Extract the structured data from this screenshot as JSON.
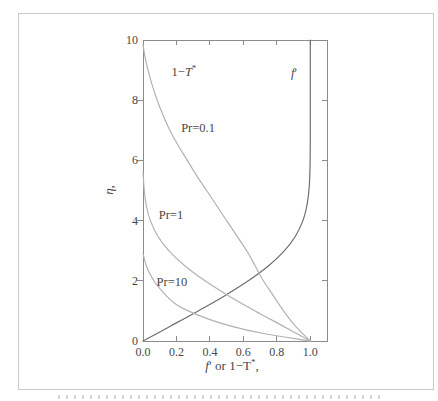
{
  "figure": {
    "background": "#ffffff",
    "border_color": "#c9c9c9"
  },
  "chart_data": {
    "type": "line",
    "title": "",
    "xlabel_parts": [
      {
        "t": "f",
        "i": true
      },
      {
        "t": "′"
      },
      {
        "t": " or 1−T"
      },
      {
        "t": "*",
        "sup": true
      },
      {
        "t": ","
      }
    ],
    "ylabel_parts": [
      {
        "t": "η",
        "i": true
      },
      {
        "t": ","
      }
    ],
    "xlim": [
      0,
      1.1
    ],
    "ylim": [
      0,
      10
    ],
    "xticks": {
      "values": [
        0,
        0.2,
        0.4,
        0.6,
        0.8,
        1.0
      ],
      "labels": [
        "0.0",
        "0.2",
        "0.4",
        "0.6",
        "0.8",
        "1.0"
      ]
    },
    "yticks": {
      "values": [
        0,
        2,
        4,
        6,
        8,
        10
      ],
      "labels": [
        "0",
        "2",
        "4",
        "6",
        "8",
        "10"
      ]
    },
    "grid": false,
    "frame": true,
    "legend": "none (in-plot annotations)",
    "colors": {
      "velocity_curve": "#6e6e6e",
      "temperature_curves": "#b2b2b2",
      "frame": "#8b8b8b",
      "text": "#474747"
    },
    "series": [
      {
        "name": "f' (Blasius velocity profile)",
        "color_key": "velocity_curve",
        "points": [
          [
            0,
            0
          ],
          [
            0.166,
            0.5
          ],
          [
            0.33,
            1
          ],
          [
            0.487,
            1.5
          ],
          [
            0.63,
            2
          ],
          [
            0.751,
            2.5
          ],
          [
            0.846,
            3
          ],
          [
            0.913,
            3.5
          ],
          [
            0.956,
            4
          ],
          [
            0.98,
            4.5
          ],
          [
            0.992,
            5
          ],
          [
            0.997,
            5.5
          ],
          [
            0.999,
            6
          ],
          [
            1.0,
            6.8
          ],
          [
            1.0,
            10
          ]
        ]
      },
      {
        "name": "1-T* (Pr=0.1)",
        "color_key": "temperature_curves",
        "points": [
          [
            1.0,
            0
          ],
          [
            0.91,
            0.5
          ],
          [
            0.84,
            1
          ],
          [
            0.78,
            1.5
          ],
          [
            0.72,
            2
          ],
          [
            0.67,
            2.5
          ],
          [
            0.62,
            3
          ],
          [
            0.56,
            3.5
          ],
          [
            0.5,
            4
          ],
          [
            0.44,
            4.5
          ],
          [
            0.38,
            5
          ],
          [
            0.32,
            5.5
          ],
          [
            0.265,
            6
          ],
          [
            0.21,
            6.5
          ],
          [
            0.16,
            7
          ],
          [
            0.12,
            7.5
          ],
          [
            0.085,
            8
          ],
          [
            0.055,
            8.5
          ],
          [
            0.03,
            9
          ],
          [
            0.01,
            9.5
          ],
          [
            0.0,
            9.85
          ]
        ]
      },
      {
        "name": "1-T* (Pr=1)",
        "color_key": "temperature_curves",
        "points": [
          [
            1.0,
            0
          ],
          [
            0.835,
            0.5
          ],
          [
            0.67,
            1
          ],
          [
            0.513,
            1.5
          ],
          [
            0.37,
            2
          ],
          [
            0.25,
            2.5
          ],
          [
            0.154,
            3
          ],
          [
            0.087,
            3.5
          ],
          [
            0.044,
            4
          ],
          [
            0.02,
            4.5
          ],
          [
            0.008,
            5
          ],
          [
            0.0,
            5.6
          ]
        ]
      },
      {
        "name": "1-T* (Pr=10)",
        "color_key": "temperature_curves",
        "points": [
          [
            1.0,
            0
          ],
          [
            0.72,
            0.25
          ],
          [
            0.52,
            0.5
          ],
          [
            0.38,
            0.75
          ],
          [
            0.27,
            1
          ],
          [
            0.19,
            1.25
          ],
          [
            0.14,
            1.5
          ],
          [
            0.1,
            1.75
          ],
          [
            0.065,
            2
          ],
          [
            0.04,
            2.25
          ],
          [
            0.02,
            2.5
          ],
          [
            0.0,
            2.9
          ]
        ]
      }
    ],
    "annotations": [
      {
        "id": "label-1-minus-Tstar",
        "x": 0.245,
        "y": 8.8,
        "parts": [
          {
            "t": "1−"
          },
          {
            "t": "T",
            "i": true
          },
          {
            "t": "*",
            "sup": true
          }
        ]
      },
      {
        "id": "label-f-prime",
        "x": 0.903,
        "y": 8.77,
        "parts": [
          {
            "t": "f",
            "i": true
          },
          {
            "t": "′"
          }
        ]
      },
      {
        "id": "label-pr-0.1",
        "x": 0.329,
        "y": 6.94,
        "parts": [
          {
            "t": "Pr=0.1"
          }
        ]
      },
      {
        "id": "label-pr-1",
        "x": 0.167,
        "y": 4.05,
        "parts": [
          {
            "t": "Pr=1"
          }
        ]
      },
      {
        "id": "label-pr-10",
        "x": 0.173,
        "y": 1.83,
        "parts": [
          {
            "t": "Pr=10"
          }
        ]
      }
    ]
  }
}
